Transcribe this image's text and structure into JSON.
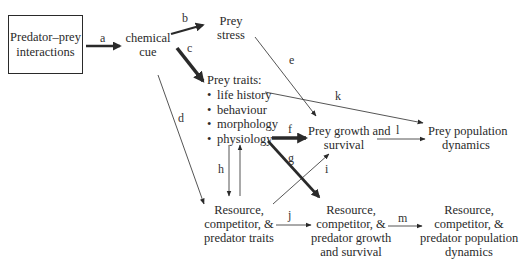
{
  "diagram": {
    "nodes": {
      "predator_prey": {
        "line1": "Predator–prey",
        "line2": "interactions"
      },
      "chemical_cue": {
        "line1": "chemical",
        "line2": "cue"
      },
      "prey_stress": {
        "line1": "Prey",
        "line2": "stress"
      },
      "prey_traits": {
        "title": "Prey traits:",
        "items": [
          "life history",
          "behaviour",
          "morphology",
          "physiology"
        ]
      },
      "prey_growth": {
        "line1": "Prey growth and",
        "line2": "survival"
      },
      "prey_population": {
        "line1": "Prey population",
        "line2": "dynamics"
      },
      "rcp_traits": {
        "line1": "Resource,",
        "line2": "competitor, &",
        "line3": "predator traits"
      },
      "rcp_growth": {
        "line1": "Resource,",
        "line2": "competitor, &",
        "line3": "predator growth",
        "line4": "and survival"
      },
      "rcp_population": {
        "line1": "Resource,",
        "line2": "competitor, &",
        "line3": "predator population",
        "line4": "dynamics"
      }
    },
    "edges": [
      {
        "label": "a",
        "from": "predator_prey",
        "to": "chemical_cue",
        "weight": "thick"
      },
      {
        "label": "b",
        "from": "chemical_cue",
        "to": "prey_stress",
        "weight": "thick"
      },
      {
        "label": "c",
        "from": "chemical_cue",
        "to": "prey_traits",
        "weight": "heavy"
      },
      {
        "label": "d",
        "from": "chemical_cue",
        "to": "rcp_traits",
        "weight": "thin"
      },
      {
        "label": "e",
        "from": "prey_stress",
        "to": "prey_growth",
        "weight": "thin"
      },
      {
        "label": "f",
        "from": "prey_traits",
        "to": "prey_growth",
        "weight": "heavy"
      },
      {
        "label": "g",
        "from": "prey_traits",
        "to": "rcp_growth",
        "weight": "heavy"
      },
      {
        "label": "h",
        "from": "prey_traits",
        "to": "rcp_traits",
        "weight": "thin",
        "bidirectional": true
      },
      {
        "label": "i",
        "from": "rcp_traits",
        "to": "prey_growth",
        "weight": "thin"
      },
      {
        "label": "j",
        "from": "rcp_traits",
        "to": "rcp_growth",
        "weight": "thin"
      },
      {
        "label": "k",
        "from": "prey_traits",
        "to": "prey_population",
        "weight": "thin"
      },
      {
        "label": "l",
        "from": "prey_growth",
        "to": "prey_population",
        "weight": "thin"
      },
      {
        "label": "m",
        "from": "rcp_growth",
        "to": "rcp_population",
        "weight": "thin"
      }
    ],
    "colors": {
      "ink": "#2a2a2a",
      "background": "#ffffff"
    }
  }
}
